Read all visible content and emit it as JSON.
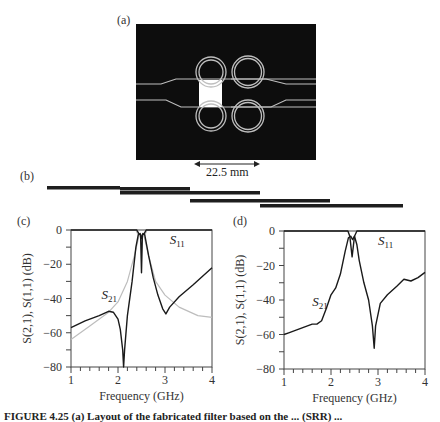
{
  "figure": {
    "panels": {
      "a": {
        "label": "(a)",
        "scale_bar": "22.5 mm"
      },
      "b": {
        "label": "(b)"
      },
      "c": {
        "label": "(c)"
      },
      "d": {
        "label": "(d)"
      }
    },
    "caption": "FIGURE 4.25   (a) Layout of the fabricated filter based on the ... (SRR) ..."
  },
  "colors": {
    "measured": "#1a1a1a",
    "simulated": "#bdbdbd",
    "layout_bg": "#0d0d0d",
    "layout_lines": "#bfbfbf"
  },
  "chart_data": [
    {
      "panel": "c",
      "type": "line",
      "title": "",
      "xlabel": "Frequency (GHz)",
      "ylabel": "S(2,1), S(1,1) (dB)",
      "xlim": [
        1,
        4
      ],
      "ylim": [
        -80,
        0
      ],
      "xticks": [
        "1",
        "2",
        "3",
        "4"
      ],
      "yticks": [
        "0",
        "-20",
        "-40",
        "-60",
        "-80"
      ],
      "grid": false,
      "annotations": [
        {
          "text": "S11",
          "x": 3.1,
          "y": -6
        },
        {
          "text": "S21",
          "x": 1.65,
          "y": -38
        }
      ],
      "series": [
        {
          "name": "S21 (measured)",
          "style": "dark",
          "x": [
            1.0,
            1.3,
            1.6,
            1.8,
            1.9,
            2.0,
            2.05,
            2.1,
            2.12,
            2.14,
            2.2,
            2.3,
            2.38,
            2.43,
            2.47,
            2.5,
            2.53,
            2.57,
            2.65,
            2.75,
            2.85,
            2.95,
            3.02,
            3.1,
            3.3,
            3.6,
            4.0
          ],
          "y": [
            -57,
            -53,
            -50,
            -47.5,
            -48,
            -52,
            -58,
            -70,
            -80,
            -70,
            -50,
            -30,
            -10,
            -3,
            -2,
            -5,
            -2,
            -3,
            -15,
            -28,
            -38,
            -46,
            -49,
            -45,
            -39,
            -32,
            -22
          ]
        },
        {
          "name": "S21 (simulated)",
          "style": "light",
          "x": [
            1.0,
            1.4,
            1.8,
            2.0,
            2.2,
            2.35,
            2.45,
            2.55,
            2.65,
            2.8,
            3.0,
            3.3,
            3.7,
            4.0
          ],
          "y": [
            -64,
            -56,
            -48,
            -42,
            -30,
            -15,
            -3,
            -3,
            -15,
            -30,
            -38,
            -45,
            -50,
            -51
          ]
        },
        {
          "name": "S11 (measured)",
          "style": "dark",
          "x": [
            1.0,
            2.4,
            2.44,
            2.48,
            2.5,
            2.52,
            2.56,
            2.6,
            4.0
          ],
          "y": [
            0,
            0,
            -2,
            -3,
            -25,
            -3,
            -2,
            0,
            0
          ]
        },
        {
          "name": "S11 (simulated)",
          "style": "light",
          "x": [
            1.0,
            2.38,
            2.43,
            2.5,
            2.57,
            2.62,
            4.0
          ],
          "y": [
            0,
            0,
            -3,
            -4,
            -3,
            0,
            0
          ]
        }
      ]
    },
    {
      "panel": "d",
      "type": "line",
      "title": "",
      "xlabel": "Frequency (GHz)",
      "ylabel": "S(2,1), S(1,1) (dB)",
      "xlim": [
        1,
        4
      ],
      "ylim": [
        -80,
        0
      ],
      "xticks": [
        "1",
        "2",
        "3",
        "4"
      ],
      "yticks": [
        "0",
        "-20",
        "-40",
        "-60",
        "-80"
      ],
      "grid": false,
      "annotations": [
        {
          "text": "S11",
          "x": 3.0,
          "y": -6
        },
        {
          "text": "S21",
          "x": 1.6,
          "y": -41
        }
      ],
      "series": [
        {
          "name": "S21 (measured)",
          "style": "dark",
          "x": [
            1.0,
            1.1,
            1.2,
            1.3,
            1.4,
            1.5,
            1.6,
            1.7,
            1.8,
            1.9,
            2.0,
            2.1,
            2.2,
            2.3,
            2.37,
            2.42,
            2.46,
            2.5,
            2.55,
            2.6,
            2.7,
            2.8,
            2.88,
            2.92,
            2.95,
            3.05,
            3.2,
            3.4,
            3.55,
            3.7,
            3.85,
            4.0
          ],
          "y": [
            -60,
            -59,
            -58,
            -57,
            -56,
            -55,
            -54,
            -54,
            -52,
            -45,
            -37,
            -33,
            -25,
            -12,
            -4,
            -3,
            -5,
            -3,
            -8,
            -17,
            -30,
            -40,
            -55,
            -68,
            -55,
            -42,
            -37,
            -32,
            -28,
            -29,
            -27,
            -24
          ]
        },
        {
          "name": "S11 (measured)",
          "style": "dark",
          "x": [
            1.0,
            2.36,
            2.4,
            2.45,
            2.5,
            2.55,
            4.0
          ],
          "y": [
            0,
            0,
            -3,
            -15,
            -3,
            0,
            0
          ]
        }
      ]
    }
  ]
}
